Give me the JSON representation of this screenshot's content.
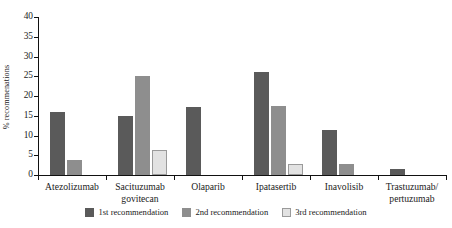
{
  "chart_data": {
    "type": "bar",
    "title": "",
    "xlabel": "",
    "ylabel": "% recommenations",
    "ylim": [
      0,
      40
    ],
    "yticks": [
      0,
      5,
      10,
      15,
      20,
      25,
      30,
      35,
      40
    ],
    "grid": false,
    "legend_position": "bottom",
    "categories": [
      "Atezolizumab",
      "Sacituzumab govitecan",
      "Olaparib",
      "Ipatasertib",
      "Inavolisib",
      "Trastuzumab/ pertuzumab"
    ],
    "category_lines": [
      [
        "Atezolizumab"
      ],
      [
        "Sacituzumab",
        "govitecan"
      ],
      [
        "Olaparib"
      ],
      [
        "Ipatasertib"
      ],
      [
        "Inavolisib"
      ],
      [
        "Trastuzumab/",
        "pertuzumab"
      ]
    ],
    "series": [
      {
        "name": "1st recommendation",
        "color": "#5a5a5a",
        "values": [
          16.0,
          15.0,
          17.3,
          26.0,
          11.5,
          1.6
        ]
      },
      {
        "name": "2nd recommendation",
        "color": "#8e8e8e",
        "values": [
          3.7,
          25.0,
          0,
          17.5,
          2.9,
          0
        ]
      },
      {
        "name": "3rd recommendation",
        "color": "#e2e2e2",
        "values": [
          0,
          6.3,
          0,
          2.8,
          0,
          0
        ]
      }
    ]
  },
  "legend": {
    "items": [
      {
        "label": "1st recommendation"
      },
      {
        "label": "2nd recommendation"
      },
      {
        "label": "3rd recommendation"
      }
    ]
  }
}
